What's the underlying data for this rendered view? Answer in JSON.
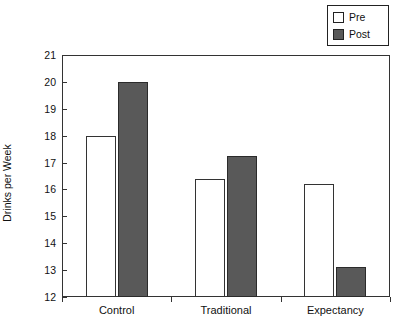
{
  "chart_data": {
    "type": "bar",
    "title": "",
    "xlabel": "",
    "ylabel": "Drinks per Week",
    "categories": [
      "Control",
      "Traditional",
      "Expectancy"
    ],
    "series": [
      {
        "name": "Pre",
        "values": [
          18.0,
          16.4,
          16.2
        ]
      },
      {
        "name": "Post",
        "values": [
          20.0,
          17.25,
          13.1
        ]
      }
    ],
    "ylim": [
      12,
      21
    ],
    "yticks": [
      12,
      13,
      14,
      15,
      16,
      17,
      18,
      19,
      20,
      21
    ],
    "ytick_labels": [
      "12",
      "13",
      "14",
      "15",
      "16",
      "17",
      "18",
      "19",
      "20",
      "21"
    ],
    "grid": false,
    "legend_position": "top-right",
    "legend_entries": [
      {
        "label": "Pre",
        "color": "#ffffff"
      },
      {
        "label": "Post",
        "color": "#595959"
      }
    ]
  },
  "colors": {
    "pre_fill": "#ffffff",
    "post_fill": "#595959",
    "outline": "#333333",
    "background": "#ffffff",
    "text": "#111111"
  }
}
